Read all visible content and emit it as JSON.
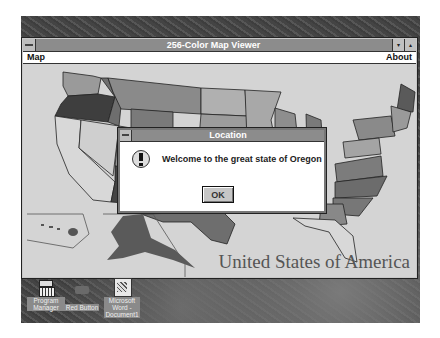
{
  "window": {
    "title": "256-Color Map Viewer",
    "menu": [
      {
        "label": "Map"
      },
      {
        "label": "About"
      }
    ],
    "controls": {
      "minimize_glyph": "▾",
      "maximize_glyph": "▴"
    }
  },
  "map": {
    "caption": "United States of America",
    "selected_state": "Oregon"
  },
  "dialog": {
    "title": "Location",
    "icon": "exclamation-icon",
    "message": "Welcome to the great state of Oregon",
    "ok_label": "OK"
  },
  "desktop_icons": [
    {
      "label": "Program Manager",
      "icon": "program-manager-icon"
    },
    {
      "label": "Red Button",
      "icon": "red-button-icon"
    },
    {
      "label": "Microsoft Word - Document1",
      "icon": "word-document-icon"
    }
  ],
  "colors": {
    "titlebar": "#8c8c8c",
    "map_bg": "#d4d4d4",
    "desktop": "#4a4a4a"
  }
}
